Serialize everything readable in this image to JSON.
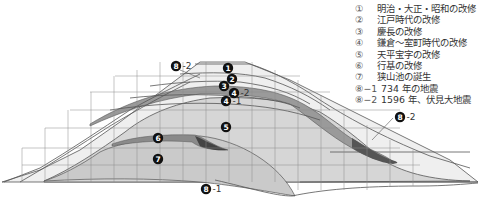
{
  "legend": {
    "items": [
      {
        "num": "①",
        "label": "明治・大正・昭和の改修"
      },
      {
        "num": "②",
        "label": "江戸時代の改修"
      },
      {
        "num": "③",
        "label": "慶長の改修"
      },
      {
        "num": "④",
        "label": "鎌倉～室町時代の改修"
      },
      {
        "num": "⑤",
        "label": "天平宝字の改修"
      },
      {
        "num": "⑥",
        "label": "行基の改修"
      },
      {
        "num": "⑦",
        "label": "狭山池の誕生"
      },
      {
        "num": "⑧−1",
        "label": "734 年の地震"
      },
      {
        "num": "⑧−2",
        "label": "1596 年、伏見大地震"
      }
    ]
  },
  "markers": [
    {
      "id": "1",
      "suffix": "",
      "x": 228,
      "y": 68
    },
    {
      "id": "2",
      "suffix": "",
      "x": 232,
      "y": 79
    },
    {
      "id": "3",
      "suffix": "",
      "x": 224,
      "y": 86
    },
    {
      "id": "4",
      "suffix": "-2",
      "x": 234,
      "y": 93
    },
    {
      "id": "4",
      "suffix": "-1",
      "x": 226,
      "y": 101
    },
    {
      "id": "5",
      "suffix": "",
      "x": 226,
      "y": 127
    },
    {
      "id": "6",
      "suffix": "",
      "x": 158,
      "y": 138
    },
    {
      "id": "7",
      "suffix": "",
      "x": 158,
      "y": 159
    },
    {
      "id": "8",
      "suffix": "-2",
      "x": 176,
      "y": 66
    },
    {
      "id": "8",
      "suffix": "-2",
      "x": 400,
      "y": 117
    },
    {
      "id": "8",
      "suffix": "-1",
      "x": 206,
      "y": 189
    }
  ],
  "colors": {
    "grid": "#8a8a8a",
    "outline": "#555555",
    "layer_light": "#ececec",
    "layer_mid": "#d6d6d6",
    "layer_base": "#cfcfcf",
    "layer_dark": "#8c8c8c",
    "layer_darker": "#555555"
  }
}
